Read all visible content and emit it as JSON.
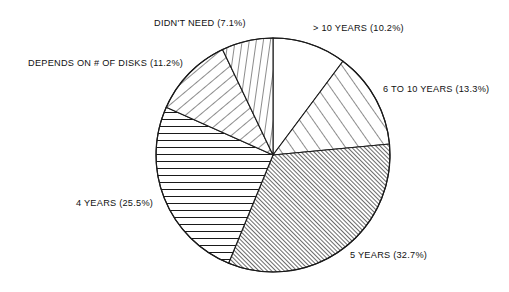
{
  "figure": {
    "background_color": "#ffffff",
    "line_color": "#1a1a1a",
    "center_x": 273,
    "center_y": 155,
    "radius": 117
  },
  "chart_data": {
    "type": "pie",
    "title": "",
    "subtitle": "",
    "xlabel": "",
    "ylabel": "",
    "grid": false,
    "legend_position": "none",
    "labels_position": "outside-callout",
    "start_angle_deg": 90,
    "direction": "clockwise",
    "units": "percent",
    "categories": [
      "> 10 YEARS",
      "6 TO 10 YEARS",
      "5 YEARS",
      "4 YEARS",
      "DEPENDS ON # OF DISKS",
      "DIDN'T NEED"
    ],
    "values": [
      10.2,
      13.3,
      32.7,
      25.5,
      11.2,
      7.1
    ],
    "slices": [
      {
        "name": "> 10 YEARS",
        "value": 10.2,
        "label": "> 10 YEARS (10.2%)",
        "hatch": "none",
        "start_deg": 0.0,
        "end_deg": 36.72
      },
      {
        "name": "6 TO 10 YEARS",
        "value": 13.3,
        "label": "6 TO 10 YEARS (13.3%)",
        "hatch": "diagonal-forward-wide",
        "start_deg": 36.72,
        "end_deg": 84.6
      },
      {
        "name": "5 YEARS",
        "value": 32.7,
        "label": "5 YEARS (32.7%)",
        "hatch": "diagonal-forward-dense",
        "start_deg": 84.6,
        "end_deg": 202.32
      },
      {
        "name": "4 YEARS",
        "value": 25.5,
        "label": "4 YEARS (25.5%)",
        "hatch": "horizontal",
        "start_deg": 202.32,
        "end_deg": 294.12
      },
      {
        "name": "DEPENDS ON # OF DISKS",
        "value": 11.2,
        "label": "DEPENDS ON # OF DISKS (11.2%)",
        "hatch": "diagonal-back-wide",
        "start_deg": 294.12,
        "end_deg": 334.44
      },
      {
        "name": "DIDN'T NEED",
        "value": 7.1,
        "label": "DIDN'T NEED (7.1%)",
        "hatch": "vertical-steep",
        "start_deg": 334.44,
        "end_deg": 360.0
      }
    ],
    "labels": [
      "DIDN'T NEED (7.1%)",
      "> 10 YEARS (10.2%)",
      "DEPENDS ON # OF DISKS (11.2%)",
      "6 TO 10 YEARS (13.3%)",
      "4 YEARS (25.5%)",
      "5 YEARS (32.7%)"
    ],
    "total": 100.0
  }
}
